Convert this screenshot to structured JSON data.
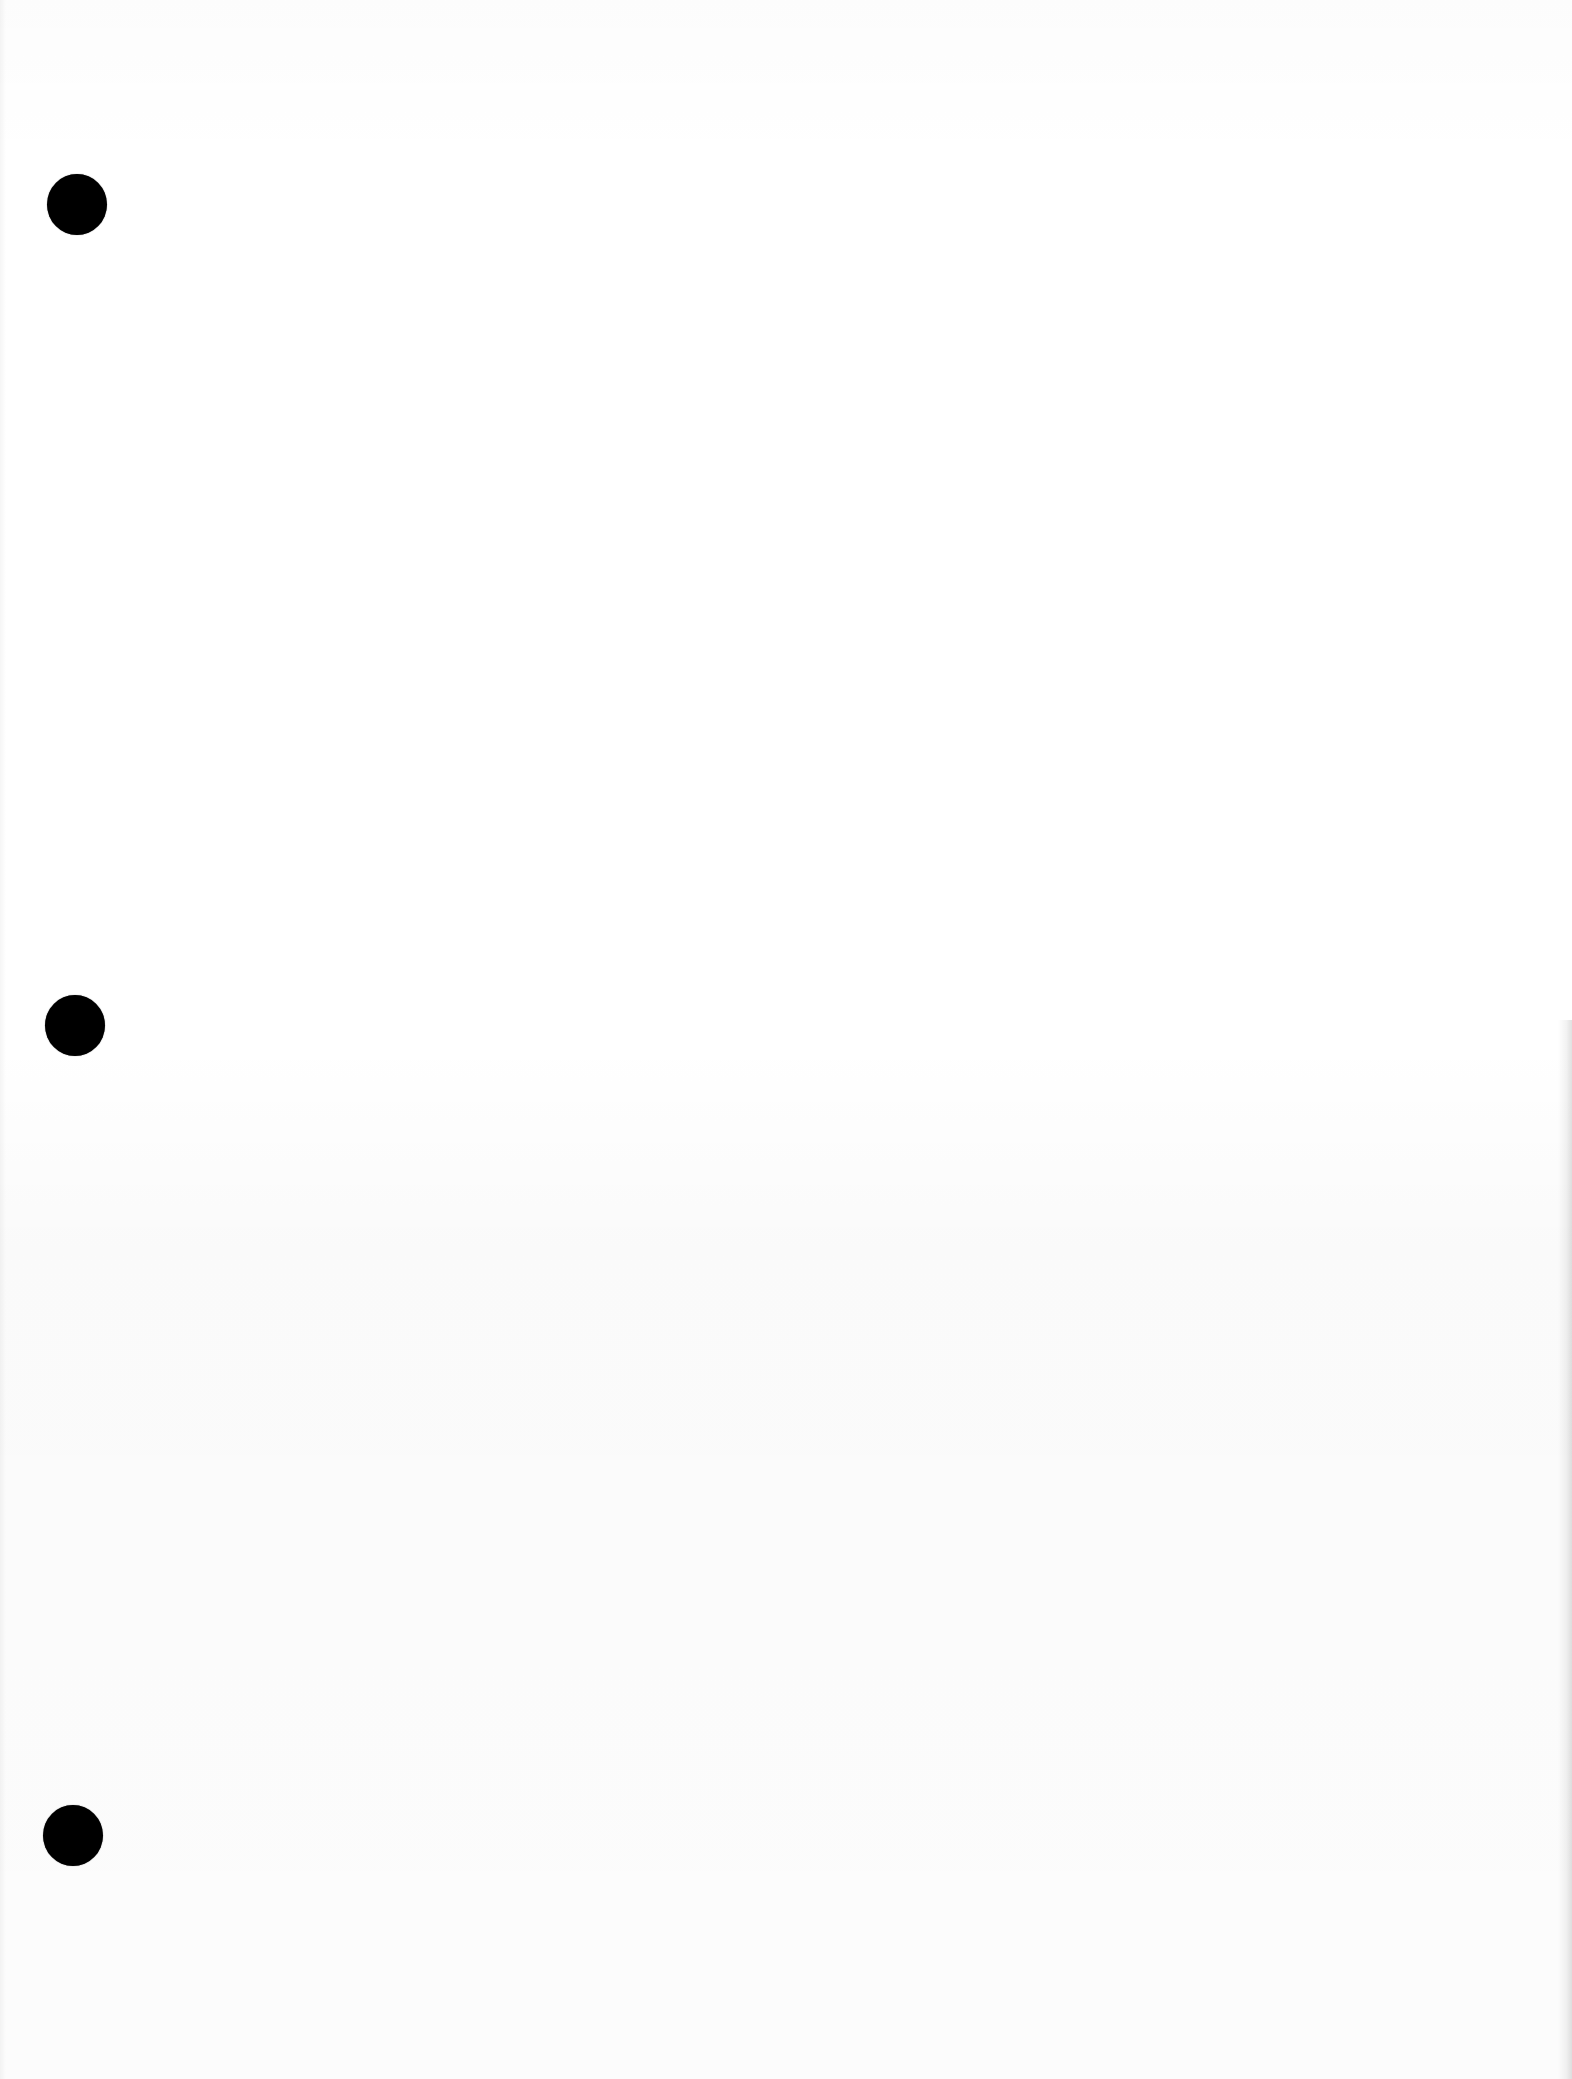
{
  "document": {
    "type": "blank scanned page",
    "background_color": "#ffffff",
    "text_content": "",
    "punch_holes": [
      {
        "position": "top",
        "color": "#000000"
      },
      {
        "position": "middle",
        "color": "#000000"
      },
      {
        "position": "bottom",
        "color": "#000000"
      }
    ]
  }
}
